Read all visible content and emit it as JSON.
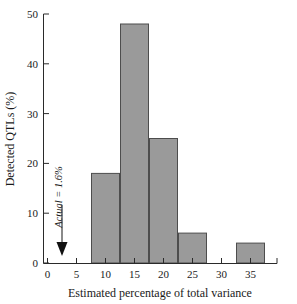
{
  "chart_data": {
    "type": "bar",
    "title": "",
    "subtitle": "",
    "xlabel": "Estimated percentage of total variance",
    "ylabel": "Detected QTLs (%)",
    "xlim": [
      -1.5,
      38.5
    ],
    "ylim": [
      0,
      50
    ],
    "xticks": [
      0,
      5,
      10,
      15,
      20,
      25,
      30,
      35
    ],
    "xtick_labels": [
      "0",
      "5",
      "10",
      "15",
      "20",
      "25",
      "30",
      "35"
    ],
    "yticks": [
      0,
      10,
      20,
      30,
      40,
      50
    ],
    "ytick_labels": [
      "0",
      "10",
      "20",
      "30",
      "40",
      "50"
    ],
    "grid": false,
    "legend": null,
    "bin_width": 5,
    "bin_edges": [
      7.5,
      12.5,
      17.5,
      22.5,
      27.5,
      32.5,
      37.5
    ],
    "categories": [
      "7.5-12.5",
      "12.5-17.5",
      "17.5-22.5",
      "22.5-27.5",
      "27.5-32.5",
      "32.5-37.5"
    ],
    "bin_centers": [
      10,
      15,
      20,
      25,
      30,
      35
    ],
    "values": [
      18,
      48,
      25,
      6,
      0,
      4
    ],
    "bars": [
      {
        "x0": 7.5,
        "x1": 12.5,
        "value": 18
      },
      {
        "x0": 12.5,
        "x1": 17.5,
        "value": 48
      },
      {
        "x0": 17.5,
        "x1": 22.5,
        "value": 25
      },
      {
        "x0": 22.5,
        "x1": 27.5,
        "value": 6
      },
      {
        "x0": 27.5,
        "x1": 32.5,
        "value": 0
      },
      {
        "x0": 32.5,
        "x1": 37.5,
        "value": 4
      }
    ],
    "annotations": [
      {
        "text": "Actual = 1.6%",
        "x": 2.5,
        "y_text_top": 33,
        "arrow_from_y": 28,
        "arrow_to_y": 2.5,
        "orientation": "vertical"
      }
    ],
    "colors": {
      "bar_fill": "#9a9a9a",
      "bar_stroke": "#4d4d4d",
      "axis": "#2a2a2a",
      "text": "#1a1a1a",
      "background": "#ffffff"
    }
  }
}
